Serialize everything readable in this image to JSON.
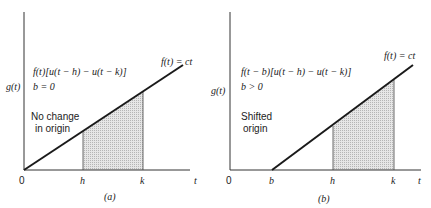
{
  "figure": {
    "panels": [
      {
        "id": "a",
        "caption": "(a)",
        "y_axis_label": "g(t)",
        "x_axis_label": "t",
        "line_label": "f(t) = ct",
        "expression": "f(t)[u(t − h) − u(t − k)]",
        "condition": "b = 0",
        "note_line1": "No change",
        "note_line2": "in origin",
        "ticks": {
          "origin": "0",
          "h": "h",
          "k": "k"
        }
      },
      {
        "id": "b",
        "caption": "(b)",
        "y_axis_label": "g(t)",
        "x_axis_label": "t",
        "line_label": "f(t) = ct",
        "expression": "f(t − b)[u(t − h) − u(t − k)]",
        "condition": "b > 0",
        "note_line1": "Shifted",
        "note_line2": "origin",
        "ticks": {
          "origin": "0",
          "b": "b",
          "h": "h",
          "k": "k"
        }
      }
    ],
    "colors": {
      "line": "#1a1a1a",
      "shade": "#d8d8d8",
      "axis": "#333333"
    }
  }
}
